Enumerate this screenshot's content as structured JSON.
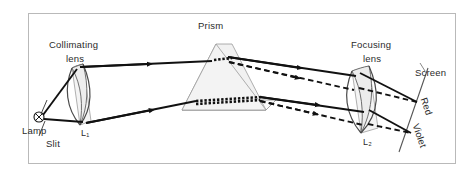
{
  "figure": {
    "background": "#ffffff",
    "frame_color": "#b9b9b9",
    "ray_color": "#111111",
    "prism_fill": "#f0f0f0",
    "lens_fill": "#ececec"
  },
  "labels": {
    "collimating_lens_line1": "Collimating",
    "collimating_lens_line2": "lens",
    "prism": "Prism",
    "focusing_lens_line1": "Focusing",
    "focusing_lens_line2": "lens",
    "screen": "Screen",
    "lamp": "Lamp",
    "slit": "Slit",
    "lens1": "L₁",
    "lens2": "L₂",
    "red": "Red",
    "violet": "Violet"
  },
  "components": [
    {
      "name": "lamp",
      "label": "Lamp",
      "icon": "crossed-circle-icon"
    },
    {
      "name": "slit",
      "label": "Slit"
    },
    {
      "name": "collimating-lens",
      "label": "L₁",
      "caption": "Collimating lens"
    },
    {
      "name": "prism",
      "label": "Prism"
    },
    {
      "name": "focusing-lens",
      "label": "L₂",
      "caption": "Focusing lens"
    },
    {
      "name": "screen",
      "label": "Screen"
    }
  ],
  "rays": [
    {
      "name": "red-ray",
      "style": "solid",
      "label": "Red"
    },
    {
      "name": "violet-ray",
      "style": "dashed",
      "label": "Violet"
    }
  ]
}
